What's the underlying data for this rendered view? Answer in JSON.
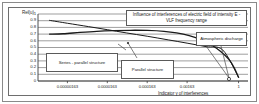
{
  "chart_data": {
    "type": "line",
    "title": "Influence of interferences of electric field of intensity E - VLF frequency range",
    "xlabel": "Indicator  γ  of interferences",
    "ylabel": "Rel(u)",
    "grid": true,
    "legend_position": "none",
    "x_tick_labels": [
      "0.00000163",
      "0.0000163",
      "0.000163",
      "0.00163",
      "1"
    ],
    "x_tick_positions": [
      0.14,
      0.33,
      0.52,
      0.71,
      0.955
    ],
    "y_tick_labels": [
      "1",
      "0.9",
      "0.8",
      "0.7",
      "0.6",
      "0.5",
      "0.4",
      "0.3",
      "0.2",
      "0.1",
      "0"
    ],
    "ylim": [
      0,
      1
    ],
    "series": [
      {
        "name": "Series - parallel structure",
        "points": [
          [
            0.055,
            0.905
          ],
          [
            0.14,
            0.862
          ],
          [
            0.24,
            0.812
          ],
          [
            0.33,
            0.766
          ],
          [
            0.42,
            0.718
          ],
          [
            0.52,
            0.668
          ],
          [
            0.62,
            0.614
          ],
          [
            0.71,
            0.565
          ],
          [
            0.8,
            0.513
          ],
          [
            0.88,
            0.462
          ],
          [
            0.955,
            0.055
          ]
        ]
      },
      {
        "name": "Parallel structure",
        "points": [
          [
            0.055,
            0.7
          ],
          [
            0.12,
            0.705
          ],
          [
            0.2,
            0.725
          ],
          [
            0.28,
            0.742
          ],
          [
            0.36,
            0.752
          ],
          [
            0.44,
            0.757
          ],
          [
            0.52,
            0.755
          ],
          [
            0.6,
            0.742
          ],
          [
            0.66,
            0.718
          ],
          [
            0.72,
            0.676
          ],
          [
            0.78,
            0.612
          ],
          [
            0.83,
            0.53
          ],
          [
            0.87,
            0.44
          ],
          [
            0.91,
            0.32
          ],
          [
            0.935,
            0.195
          ],
          [
            0.955,
            0.055
          ]
        ]
      }
    ],
    "annotations": [
      {
        "name": "title-callout",
        "text": "Influence of interferences of electric field of intensity E - VLF frequency range"
      },
      {
        "name": "atmospheric-discharge-callout",
        "text": "Atmospheric discharge"
      },
      {
        "name": "series-parallel-callout",
        "text": "Series - parallel structure"
      },
      {
        "name": "parallel-callout",
        "text": "Parallel structure"
      }
    ],
    "colors": {
      "curve": "#1a1a1a",
      "grid": "#5d5d5d",
      "axis": "#3a3a3a",
      "frame": "#6e6e6e",
      "background": "#ffffff"
    }
  }
}
